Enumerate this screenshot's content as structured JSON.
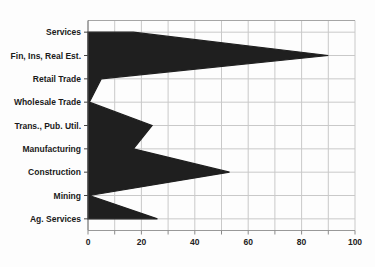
{
  "chart_data": {
    "type": "area",
    "orientation": "horizontal",
    "title": "",
    "xlabel": "",
    "ylabel": "",
    "categories": [
      "Services",
      "Fin, Ins, Real Est.",
      "Retail Trade",
      "Wholesale Trade",
      "Trans., Pub. Util.",
      "Manufacturing",
      "Construction",
      "Mining",
      "Ag. Services"
    ],
    "values": [
      17,
      90,
      5,
      0.5,
      24,
      17,
      53,
      0.5,
      26
    ],
    "xlim": [
      0,
      100
    ],
    "xtick_labels": [
      "0",
      "20",
      "40",
      "60",
      "80",
      "100"
    ],
    "xticks": [
      0,
      20,
      40,
      60,
      80,
      100
    ],
    "minor_grid_step": 10,
    "grid": true,
    "legend": false
  },
  "colors": {
    "background": "#fdfdfd",
    "area_fill": "#1f1f1f",
    "gridline": "#c9c9c9",
    "frame": "#a5a5a5",
    "x_axis": "#999999",
    "y_axis": "#555555",
    "tick": "#8a8a8a",
    "y_tick": "#444444",
    "label_text": "#1a1a1a"
  },
  "layout_values": {
    "plot_left": 88,
    "plot_right": 355,
    "plot_top": 20.5,
    "plot_bottom": 230.5
  }
}
